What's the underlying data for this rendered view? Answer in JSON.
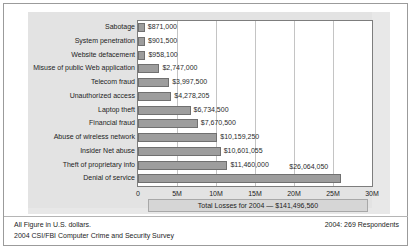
{
  "chart_data": {
    "type": "bar",
    "orientation": "horizontal",
    "title": "",
    "xlabel": "",
    "ylabel": "",
    "categories": [
      "Sabotage",
      "System penetration",
      "Website defacement",
      "Misuse of public Web application",
      "Telecom fraud",
      "Unauthorized access",
      "Laptop theft",
      "Financial fraud",
      "Abuse of wireless network",
      "Insider Net abuse",
      "Theft of proprietary info",
      "Denial of service"
    ],
    "values": [
      871000,
      901500,
      958100,
      2747000,
      3997500,
      4278205,
      6734500,
      7670500,
      10159250,
      10601055,
      11460000,
      26064050
    ],
    "value_labels": [
      "$871,000",
      "$901,500",
      "$958,100",
      "$2,747,000",
      "$3,997,500",
      "$4,278,205",
      "$6,734,500",
      "$7,670,500",
      "$10,159,250",
      "$10,601,055",
      "$11,460,000",
      "$26,064,050"
    ],
    "xlim": [
      0,
      30000000
    ],
    "xticks": [
      0,
      5000000,
      10000000,
      15000000,
      20000000,
      25000000,
      30000000
    ],
    "xtick_labels": [
      "0",
      "5M",
      "10M",
      "15M",
      "20M",
      "25M",
      "30M"
    ],
    "grid": true,
    "legend": false,
    "bar_color": "#9d9d9d",
    "bar_border_color": "#707070"
  },
  "annotations": {
    "total_losses": "Total Losses for 2004 — $141,496,560"
  },
  "footer": {
    "line1": "All Figure in U.S. dollars.",
    "line2": "2004 CSI/FBI Computer Crime and Security Survey",
    "respondents": "2004: 269 Respondents"
  }
}
